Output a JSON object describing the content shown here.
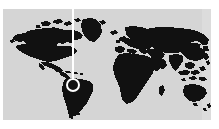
{
  "figure": {
    "kind": "world-map-graphic",
    "title": "World map",
    "alt_text": "Black silhouette world map on light gray background with a white vertical pointer line ending in a white circular marker over northern South America",
    "width_px": 219,
    "height_px": 129
  },
  "colors": {
    "page_background": "#ffffff",
    "ocean": "#d5d5d5",
    "ocean_edge_highlight": "#dcdcdc",
    "land": "#111111",
    "marker": "#ffffff",
    "pointer_line": "#ffffff"
  },
  "map": {
    "projection_note": "equirectangular",
    "plate": {
      "left": 3,
      "top": 9,
      "width": 208,
      "height": 111
    },
    "landmass_labels": [
      "North America",
      "Greenland",
      "South America",
      "Europe",
      "Africa",
      "Asia",
      "Australia",
      "Southeast Asian islands",
      "Madagascar",
      "Japan",
      "British Isles",
      "New Zealand"
    ]
  },
  "annotation": {
    "pointer_line": {
      "name": "vertical-pointer-line",
      "x_px": 72,
      "y_start_px": 0,
      "y_end_px": 80,
      "width_px": 2,
      "color": "#ffffff"
    },
    "marker": {
      "name": "location-marker",
      "shape": "ring",
      "center_x_px": 73,
      "center_y_px": 85,
      "diameter_px": 14,
      "stroke_px": 2,
      "color": "#ffffff",
      "region": "northern South America"
    }
  }
}
